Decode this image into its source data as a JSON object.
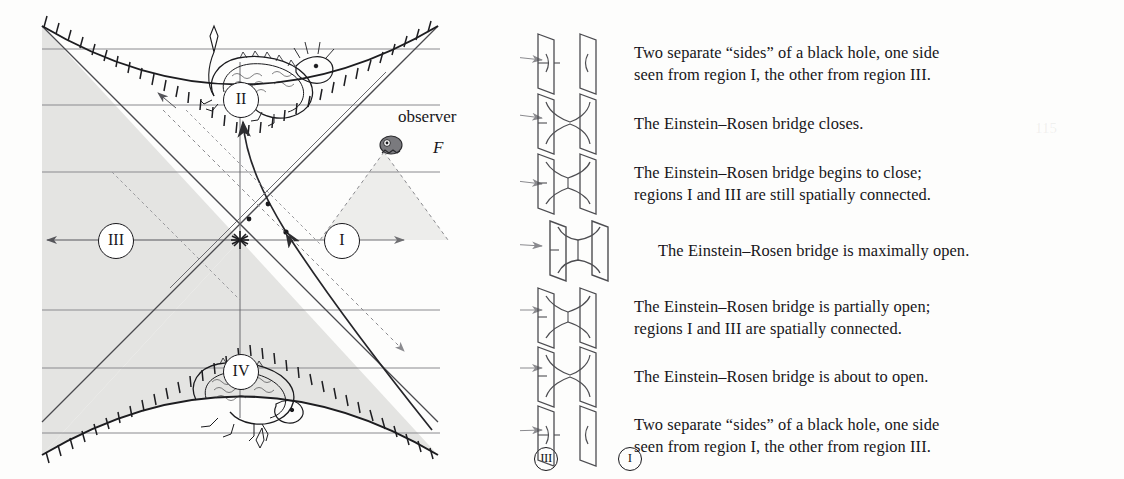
{
  "figure": {
    "type": "kruskal-penrose-diagram",
    "background_color": "#fdfdfc",
    "shaded_region_color": "#e3e3e1",
    "ink_color": "#3a3a3c",
    "text_color": "#17161a"
  },
  "diagram": {
    "observer_label": "observer",
    "observer_symbol": "F",
    "regions": [
      {
        "id": "II",
        "label": "II",
        "name": "black-hole-interior"
      },
      {
        "id": "III",
        "label": "III",
        "name": "parallel-exterior"
      },
      {
        "id": "I",
        "label": "I",
        "name": "our-exterior"
      },
      {
        "id": "IV",
        "label": "IV",
        "name": "white-hole-interior"
      }
    ],
    "singularities": [
      {
        "position": "top",
        "name": "future-singularity"
      },
      {
        "position": "bottom",
        "name": "past-singularity"
      }
    ],
    "dragons": [
      {
        "position": "top",
        "region": "II"
      },
      {
        "position": "bottom",
        "region": "IV"
      }
    ],
    "slice_count": 7,
    "slice_y": [
      49,
      105,
      172,
      240,
      310,
      368,
      433
    ]
  },
  "captions": [
    {
      "index": 0,
      "bridge_state": "separated",
      "line1": "Two separate “sides” of a black hole, one side",
      "line2": "seen from region I, the other from region III."
    },
    {
      "index": 1,
      "bridge_state": "closing-thin",
      "line1": "The Einstein–Rosen bridge closes.",
      "line2": ""
    },
    {
      "index": 2,
      "bridge_state": "closing-medium",
      "line1": "The Einstein–Rosen bridge begins to close;",
      "line2": "regions I and III are still spatially connected."
    },
    {
      "index": 3,
      "bridge_state": "maximal",
      "line1": "The Einstein–Rosen bridge is maximally open.",
      "line2": "",
      "left_tag": "III",
      "right_tag": "I"
    },
    {
      "index": 4,
      "bridge_state": "opening-medium",
      "line1": "The Einstein–Rosen bridge is partially open;",
      "line2": "regions I and III are spatially connected."
    },
    {
      "index": 5,
      "bridge_state": "opening-thin",
      "line1": "The Einstein–Rosen bridge is about to open.",
      "line2": ""
    },
    {
      "index": 6,
      "bridge_state": "separated",
      "line1": "Two separate “sides” of a black hole, one side",
      "line2": "seen from region I, the other from region III."
    }
  ]
}
